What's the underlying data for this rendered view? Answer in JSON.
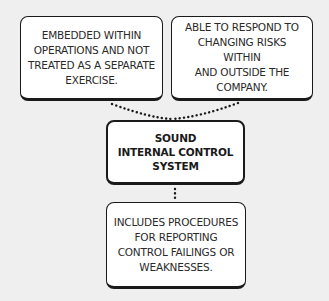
{
  "diagram": {
    "type": "flow",
    "background_color": "#efefef",
    "boxes": {
      "left": {
        "text": "EMBEDDED WITHIN\nOPERATIONS AND NOT\nTREATED AS A SEPARATE\nEXERCISE."
      },
      "right": {
        "text": "ABLE TO RESPOND TO\nCHANGING RISKS WITHIN\nAND OUTSIDE THE\nCOMPANY."
      },
      "center": {
        "text": "SOUND\nINTERNAL CONTROL\nSYSTEM"
      },
      "bottom": {
        "text": "INCLUDES PROCEDURES\nFOR REPORTING\nCONTROL FAILINGS OR\nWEAKNESSES."
      }
    },
    "connectors": [
      {
        "from": "left",
        "to": "center",
        "style": "dotted"
      },
      {
        "from": "right",
        "to": "center",
        "style": "dotted"
      },
      {
        "from": "center",
        "to": "bottom",
        "style": "dotted"
      }
    ]
  }
}
